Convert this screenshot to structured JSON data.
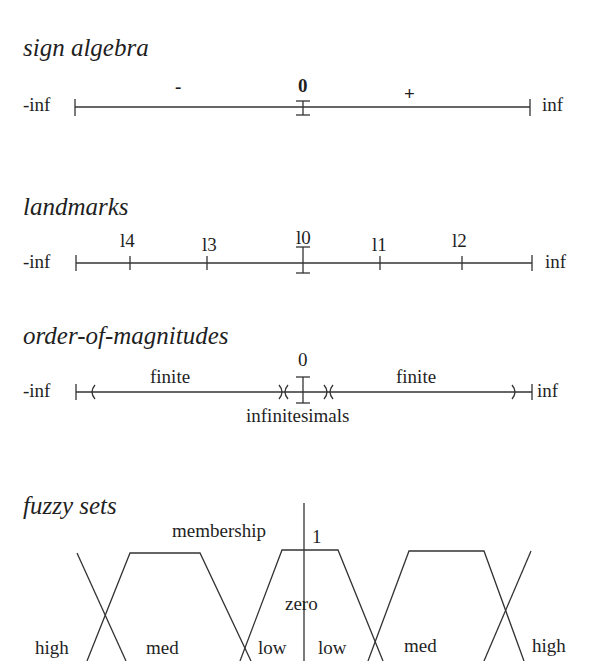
{
  "panels": {
    "sign_algebra": {
      "title": "sign algebra",
      "left_end": "-inf",
      "right_end": "inf",
      "minus": "-",
      "zero": "0",
      "plus": "+"
    },
    "landmarks": {
      "title": "landmarks",
      "left_end": "-inf",
      "right_end": "inf",
      "ticks": [
        "l4",
        "l3",
        "l0",
        "l1",
        "l2"
      ]
    },
    "order_of_magnitudes": {
      "title": "order-of-magnitudes",
      "left_end": "-inf",
      "right_end": "inf",
      "zero": "0",
      "finite_left": "finite",
      "finite_right": "finite",
      "infinitesimals": "infinitesimals"
    },
    "fuzzy_sets": {
      "title": "fuzzy sets",
      "membership": "membership",
      "one": "1",
      "zero": "zero",
      "labels": [
        "high",
        "med",
        "low",
        "low",
        "med",
        "high"
      ]
    }
  }
}
